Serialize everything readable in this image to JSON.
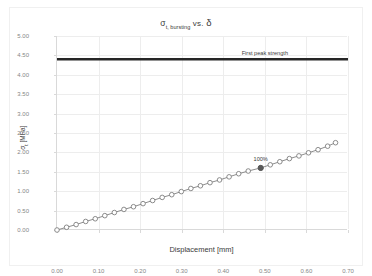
{
  "chart_data": {
    "type": "line",
    "title": "σt, bursting  vs.  δ",
    "title_main": "σ",
    "title_sub": "t, bursting",
    "title_vs": "vs.",
    "title_delta": "δ",
    "xlabel": "Displacement [mm]",
    "ylabel_main": "σ",
    "ylabel_sub": "t",
    "ylabel_unit": " [MPa]",
    "ylabel": "σt [MPa]",
    "xlim": [
      0.0,
      0.7
    ],
    "ylim": [
      0.0,
      5.0
    ],
    "xticks": [
      "0.00",
      "0.10",
      "0.20",
      "0.30",
      "0.40",
      "0.50",
      "0.60",
      "0.70"
    ],
    "xtick_values": [
      0.0,
      0.1,
      0.2,
      0.3,
      0.4,
      0.5,
      0.6,
      0.7
    ],
    "yticks": [
      "0.00",
      "0.50",
      "1.00",
      "1.50",
      "2.00",
      "2.50",
      "3.00",
      "3.50",
      "4.00",
      "4.50",
      "5.00"
    ],
    "ytick_values": [
      0.0,
      0.5,
      1.0,
      1.5,
      2.0,
      2.5,
      3.0,
      3.5,
      4.0,
      4.5,
      5.0
    ],
    "grid": true,
    "legend_position": "none",
    "series": [
      {
        "name": "σt, bursting",
        "marker": "open-circle",
        "color": "#7f7f7f",
        "x": [
          0.0,
          0.023,
          0.046,
          0.069,
          0.092,
          0.115,
          0.138,
          0.161,
          0.184,
          0.207,
          0.23,
          0.253,
          0.276,
          0.299,
          0.322,
          0.345,
          0.368,
          0.391,
          0.414,
          0.437,
          0.46,
          0.49,
          0.513,
          0.536,
          0.559,
          0.582,
          0.605,
          0.628,
          0.651,
          0.67
        ],
        "y": [
          0.0,
          0.07,
          0.14,
          0.22,
          0.29,
          0.37,
          0.45,
          0.53,
          0.6,
          0.68,
          0.76,
          0.84,
          0.91,
          0.99,
          1.07,
          1.14,
          1.22,
          1.29,
          1.37,
          1.45,
          1.52,
          1.6,
          1.68,
          1.76,
          1.84,
          1.91,
          1.99,
          2.07,
          2.16,
          2.25
        ]
      }
    ],
    "annotations": [
      {
        "label": "100%",
        "type": "highlighted-point",
        "x": 0.49,
        "y": 1.6,
        "color": "#595959"
      },
      {
        "label": "First peak strength",
        "type": "horizontal-line",
        "y": 4.4,
        "color": "#262626",
        "line_width": 2.5,
        "label_x": 0.5
      }
    ]
  }
}
